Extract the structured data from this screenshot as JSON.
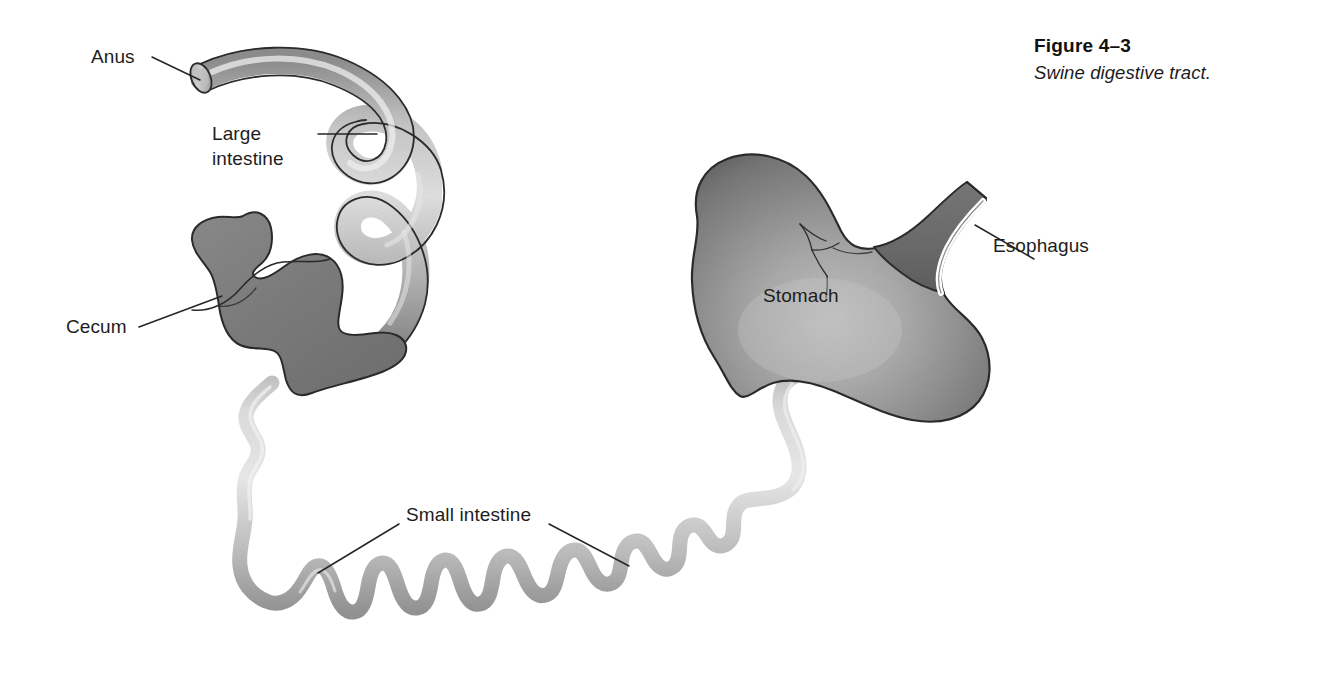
{
  "figure": {
    "number": "Figure 4–3",
    "caption": "Swine digestive tract."
  },
  "labels": {
    "anus": "Anus",
    "large_intestine_line1": "Large",
    "large_intestine_line2": "intestine",
    "cecum": "Cecum",
    "small_intestine": "Small intestine",
    "stomach": "Stomach",
    "esophagus": "Esophagus"
  },
  "colors": {
    "background": "#ffffff",
    "outline": "#2b2b2b",
    "text": "#1d1d1d",
    "large_intestine_light": "#d9d9d9",
    "large_intestine_mid": "#a8a8a8",
    "large_intestine_dark": "#7d7d7d",
    "small_intestine_light": "#dedede",
    "small_intestine_mid": "#b9b9b9",
    "small_intestine_dark": "#9a9a9a",
    "cecum_fill": "#7f7f7f",
    "stomach_light": "#b6b6b6",
    "stomach_mid": "#8d8d8d",
    "stomach_dark": "#6a6a6a",
    "esophagus_fill": "#6f6f6f",
    "esophagus_highlight": "#ffffff"
  },
  "structures": [
    {
      "name": "anus",
      "type": "tube-cut-end"
    },
    {
      "name": "large-intestine",
      "type": "coiled-thick-tube"
    },
    {
      "name": "cecum",
      "type": "filled-mass"
    },
    {
      "name": "small-intestine",
      "type": "coiled-thin-tube"
    },
    {
      "name": "stomach",
      "type": "organ-body"
    },
    {
      "name": "esophagus",
      "type": "tube"
    }
  ]
}
